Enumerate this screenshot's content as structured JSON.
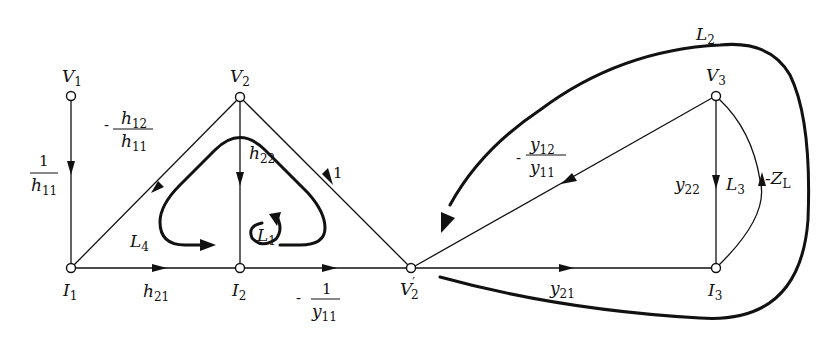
{
  "diagram": {
    "type": "signal-flow-graph",
    "nodes": [
      {
        "id": "V1",
        "label": "V",
        "sub": "1",
        "x": 71,
        "y": 96
      },
      {
        "id": "V2",
        "label": "V",
        "sub": "2",
        "x": 240,
        "y": 97
      },
      {
        "id": "V3",
        "label": "V",
        "sub": "3",
        "x": 716,
        "y": 96
      },
      {
        "id": "I1",
        "label": "I",
        "sub": "1",
        "x": 71,
        "y": 268
      },
      {
        "id": "I2",
        "label": "I",
        "sub": "2",
        "x": 240,
        "y": 268
      },
      {
        "id": "V2p",
        "label": "V",
        "sub": "2",
        "prime": "′",
        "x": 411,
        "y": 268
      },
      {
        "id": "I3",
        "label": "I",
        "sub": "3",
        "x": 716,
        "y": 268
      }
    ],
    "branches": [
      {
        "from": "V1",
        "to": "I1",
        "gain": "1/h11"
      },
      {
        "from": "V2",
        "to": "I1",
        "gain": "-h12/h11"
      },
      {
        "from": "V2",
        "to": "I2",
        "gain": "h22"
      },
      {
        "from": "V2p",
        "to": "V2",
        "gain": "1"
      },
      {
        "from": "I1",
        "to": "I2",
        "gain": "h21"
      },
      {
        "from": "I2",
        "to": "V2p",
        "gain": "-1/y11"
      },
      {
        "from": "V3",
        "to": "V2p",
        "gain": "-y12/y11"
      },
      {
        "from": "V2p",
        "to": "I3",
        "gain": "y21"
      },
      {
        "from": "V3",
        "to": "I3",
        "gain": "y22"
      },
      {
        "from": "I3",
        "to": "V3",
        "gain": "-ZL"
      }
    ],
    "loops": [
      "L1",
      "L2",
      "L3",
      "L4"
    ]
  },
  "labels": {
    "V": "V",
    "I": "I",
    "s1": "1",
    "s2": "2",
    "s3": "3",
    "prime": "′",
    "one": "1",
    "minus": "-",
    "h": "h",
    "y": "y",
    "Z": "Z",
    "s11": "11",
    "s12": "12",
    "s21": "21",
    "s22": "22",
    "sL": "L",
    "L": "L",
    "s4": "4"
  }
}
